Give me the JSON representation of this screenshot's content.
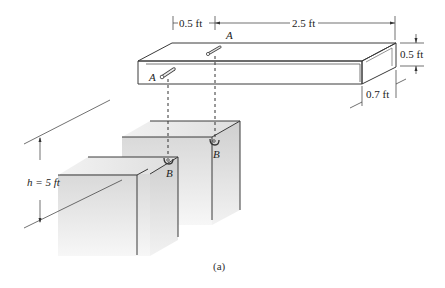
{
  "figure": {
    "caption": "(a)",
    "beam": {
      "dim_pin_offset": "0.5 ft",
      "dim_length": "2.5 ft",
      "dim_height": "0.5 ft",
      "dim_width": "0.7 ft",
      "pin_label_top": "A",
      "pin_label_front": "A"
    },
    "walls": {
      "height_label": "h = 5 ft",
      "support_label_front": "B",
      "support_label_back": "B"
    }
  }
}
